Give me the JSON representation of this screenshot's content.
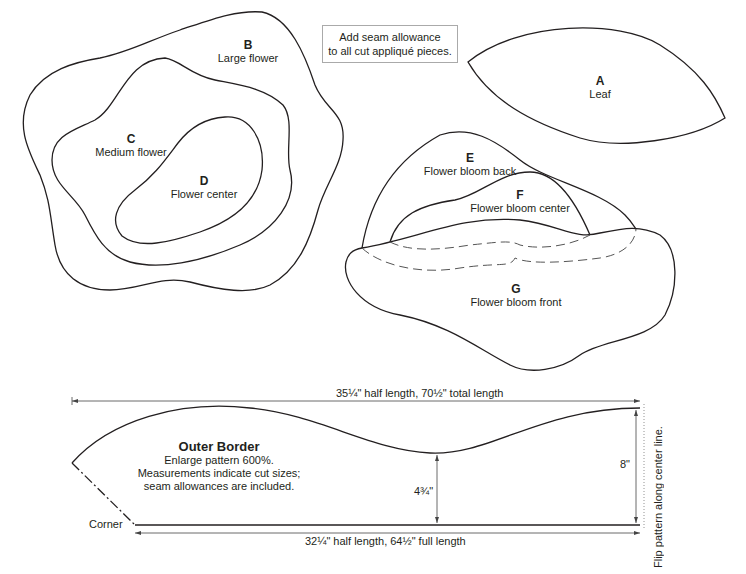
{
  "note": {
    "line1": "Add seam allowance",
    "line2": "to all cut appliqué pieces."
  },
  "pieces": [
    {
      "letter": "A",
      "name": "Leaf"
    },
    {
      "letter": "B",
      "name": "Large flower"
    },
    {
      "letter": "C",
      "name": "Medium flower"
    },
    {
      "letter": "D",
      "name": "Flower center"
    },
    {
      "letter": "E",
      "name": "Flower bloom back"
    },
    {
      "letter": "F",
      "name": "Flower bloom center"
    },
    {
      "letter": "G",
      "name": "Flower bloom front"
    }
  ],
  "outer_border": {
    "title": "Outer Border",
    "line1": "Enlarge pattern 600%.",
    "line2": "Measurements indicate cut sizes;",
    "line3": "seam allowances are included.",
    "top_dimension": "35¼\" half length, 70½\" total length",
    "bottom_dimension": "32¼\" half length, 64½\" full length",
    "mid_height": "4¾\"",
    "end_height": "8\"",
    "corner_label": "Corner",
    "flip_note": "Flip pattern along center line."
  },
  "colors": {
    "stroke": "#231f20",
    "background": "#ffffff",
    "note_border": "#aaaaaa"
  }
}
